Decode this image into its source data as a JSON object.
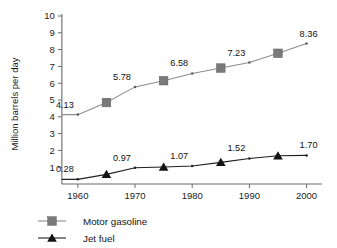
{
  "chart_data": {
    "type": "line",
    "title": "",
    "xlabel": "",
    "ylabel": "Million barrels per day",
    "xlim": [
      1956,
      2002
    ],
    "ylim": [
      0,
      10
    ],
    "grid": false,
    "legend_position": "bottom-left",
    "y_ticks": [
      1,
      2,
      3,
      4,
      5,
      6,
      7,
      8,
      9,
      10
    ],
    "y_tick_labels": [
      "1",
      "2",
      "3",
      "4",
      "5",
      "6",
      "7",
      "8",
      "9",
      "10"
    ],
    "x_ticks": [
      1960,
      1970,
      1980,
      1990,
      2000
    ],
    "x_tick_labels": [
      "1960",
      "1970",
      "1980",
      "1990",
      "2000"
    ],
    "x": [
      1960,
      1965,
      1970,
      1975,
      1980,
      1985,
      1990,
      1995,
      2000
    ],
    "series": [
      {
        "name": "Motor gasoline",
        "color": "#7a7a7a",
        "line_color": "#8d8d8d",
        "marker": "square",
        "values": [
          4.13,
          4.85,
          5.78,
          6.15,
          6.58,
          6.9,
          7.23,
          7.78,
          8.36
        ],
        "labeled_points": [
          {
            "x": 1960,
            "value": 4.13,
            "label": "4.13"
          },
          {
            "x": 1970,
            "value": 5.78,
            "label": "5.78"
          },
          {
            "x": 1980,
            "value": 6.58,
            "label": "6.58"
          },
          {
            "x": 1990,
            "value": 7.23,
            "label": "7.23"
          },
          {
            "x": 2000,
            "value": 8.36,
            "label": "8.36"
          }
        ],
        "big_marker_points": [
          1965,
          1975,
          1985,
          1995
        ]
      },
      {
        "name": "Jet fuel",
        "color": "#141414",
        "line_color": "#1f1f1f",
        "marker": "triangle",
        "values": [
          0.28,
          0.57,
          0.97,
          1.01,
          1.07,
          1.29,
          1.52,
          1.68,
          1.7
        ],
        "labeled_points": [
          {
            "x": 1960,
            "value": 0.28,
            "label": "0.28"
          },
          {
            "x": 1970,
            "value": 0.97,
            "label": "0.97"
          },
          {
            "x": 1980,
            "value": 1.07,
            "label": "1.07"
          },
          {
            "x": 1990,
            "value": 1.52,
            "label": "1.52"
          },
          {
            "x": 2000,
            "value": 1.7,
            "label": "1.70"
          }
        ],
        "big_marker_points": [
          1965,
          1975,
          1985,
          1995
        ]
      }
    ],
    "legend": [
      {
        "name": "Motor gasoline",
        "marker": "square",
        "color": "#7a7a7a"
      },
      {
        "name": "Jet fuel",
        "marker": "triangle",
        "color": "#141414"
      }
    ]
  }
}
